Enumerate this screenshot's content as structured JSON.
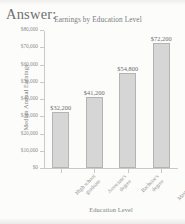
{
  "page": {
    "answer_heading": "Answer:"
  },
  "chart_data": {
    "type": "bar",
    "title": "Earnings by Education Level",
    "xlabel": "Education Level",
    "ylabel": "Median Annual Earnings",
    "categories": [
      "High school\ngraduate",
      "Associate's\ndegree",
      "Bachelor's\ndegree",
      "Master's degree\nor higher"
    ],
    "values": [
      32200,
      41200,
      54800,
      72200
    ],
    "value_labels": [
      "$32,200",
      "$41,200",
      "$54,800",
      "$72,200"
    ],
    "ylim": [
      0,
      80000
    ],
    "ytick_labels": [
      "$0",
      "$10,000",
      "$20,000",
      "$30,000",
      "$40,000",
      "$50,000",
      "$60,000",
      "$70,000",
      "$80,000"
    ],
    "ytick_values": [
      0,
      10000,
      20000,
      30000,
      40000,
      50000,
      60000,
      70000,
      80000
    ],
    "grid": false,
    "legend": false,
    "bar_color": "#d6d6d6",
    "bar_border_color": "#b4b4b4"
  }
}
